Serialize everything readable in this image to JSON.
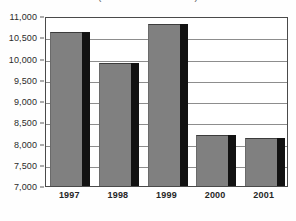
{
  "chart_data": {
    "type": "bar",
    "title": "(dollars in thousands)",
    "title_clipped": true,
    "xlabel": "",
    "ylabel": "",
    "categories": [
      "1997",
      "1998",
      "1999",
      "2000",
      "2001"
    ],
    "values": [
      10620,
      9900,
      10820,
      8200,
      8120
    ],
    "series": [
      {
        "name": "Value",
        "values": [
          10620,
          9900,
          10820,
          8200,
          8120
        ]
      }
    ],
    "ylim": [
      7000,
      11000
    ],
    "ytick_values": [
      7000,
      7500,
      8000,
      8500,
      9000,
      9500,
      10000,
      10500,
      11000
    ],
    "ytick_labels": [
      "7,000",
      "7,500",
      "8,000",
      "8,500",
      "9,000",
      "9,500",
      "10,000",
      "10,500",
      "11,000"
    ],
    "grid": true,
    "grid_axis": "y",
    "legend": false,
    "legend_position": "none",
    "bar_color": "#808080",
    "bar_shadow_color": "#121212",
    "gridline_color": "#8d8d8d",
    "frame_color": "#4a4a4a",
    "background_color": "#ffffff"
  }
}
